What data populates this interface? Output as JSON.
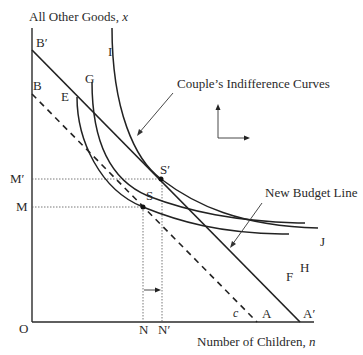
{
  "diagram": {
    "type": "economics-indifference-budget",
    "y_axis_label": "All Other Goods, ",
    "y_axis_var": "x",
    "x_axis_label": "Number of Children, ",
    "x_axis_var": "n",
    "origin_label": "O",
    "y_ticks": {
      "b_prime": "B′",
      "b": "B",
      "m_prime": "M′",
      "m": "M"
    },
    "x_ticks": {
      "n": "N",
      "n_prime": "N′",
      "a": "A",
      "a_prime": "A′"
    },
    "points": {
      "s": "S",
      "s_prime": "S′"
    },
    "curve_labels": {
      "e": "E",
      "g": "G",
      "i": "I",
      "j": "J",
      "h": "H",
      "f": "F",
      "c": "c"
    },
    "annotations": {
      "indifference": "Couple’s Indifference Curves",
      "new_budget": "New Budget Line"
    },
    "budget_lines": [
      {
        "name": "Original Budget Line",
        "from": "B",
        "to": "A",
        "style": "dashed"
      },
      {
        "name": "New Budget Line",
        "from": "B′",
        "to": "A′",
        "style": "solid"
      }
    ],
    "indifference_curves": [
      {
        "top": "E",
        "end": "F",
        "tangent_point": "S"
      },
      {
        "top": "G",
        "end": "H"
      },
      {
        "top": "I",
        "end": "J",
        "tangent_point": "S′"
      }
    ],
    "shift": {
      "from": "N",
      "to": "N′",
      "direction": "right"
    }
  }
}
